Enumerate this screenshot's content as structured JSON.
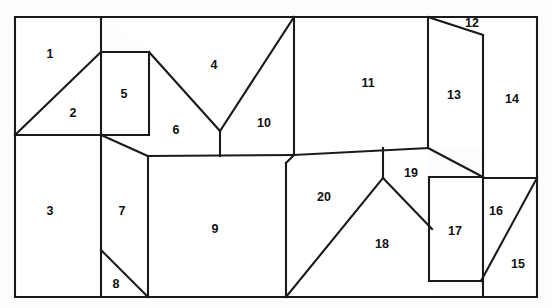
{
  "diagram": {
    "kind": "polygon-subdivision",
    "canvas": {
      "width": 552,
      "height": 308
    },
    "outer_boundary": {
      "name": "outer-rectangle",
      "left": 15,
      "top": 17,
      "right": 537,
      "bottom": 297,
      "points": "15,17 537,17 537,297 15,297"
    },
    "style": {
      "stroke_color": "#1a1a1a",
      "fill_color": "#ffffff",
      "background_color": "#fdfdfd",
      "label_color": "#111111",
      "stroke_width": 2.1
    },
    "region_count": 20,
    "regions": [
      {
        "id": 1,
        "label": "1",
        "label_x": 50,
        "label_y": 55,
        "points": "15,17 101,17 101,52 15,135"
      },
      {
        "id": 2,
        "label": "2",
        "label_x": 73,
        "label_y": 114,
        "points": "15,135 101,52 101,135"
      },
      {
        "id": 3,
        "label": "3",
        "label_x": 50,
        "label_y": 212,
        "points": "15,135 101,135 101,297 15,297"
      },
      {
        "id": 4,
        "label": "4",
        "label_x": 214,
        "label_y": 66,
        "points": "101,17 294,17 220,131 149,52"
      },
      {
        "id": 5,
        "label": "5",
        "label_x": 124,
        "label_y": 95,
        "points": "101,52 149,52 149,135 101,135"
      },
      {
        "id": 6,
        "label": "6",
        "label_x": 176,
        "label_y": 131,
        "points": "149,52 220,131 220,156 148,156 101,135 149,135"
      },
      {
        "id": 7,
        "label": "7",
        "label_x": 122,
        "label_y": 212,
        "points": "101,135 148,156 148,297 101,297"
      },
      {
        "id": 8,
        "label": "8",
        "label_x": 116,
        "label_y": 285,
        "points": "101,250 148,297 101,297"
      },
      {
        "id": 9,
        "label": "9",
        "label_x": 215,
        "label_y": 230,
        "points": "148,156 286,156 286,297 148,297"
      },
      {
        "id": 10,
        "label": "10",
        "label_x": 264,
        "label_y": 124,
        "points": "220,131 294,17 294,156 220,156"
      },
      {
        "id": 11,
        "label": "11",
        "label_x": 368,
        "label_y": 84,
        "points": "294,17 428,17 428,148 294,155"
      },
      {
        "id": 12,
        "label": "12",
        "label_x": 472,
        "label_y": 24,
        "points": "428,17 483,17 483,35"
      },
      {
        "id": 13,
        "label": "13",
        "label_x": 454,
        "label_y": 96,
        "points": "428,17 483,35 483,148 428,148"
      },
      {
        "id": 14,
        "label": "14",
        "label_x": 512,
        "label_y": 100,
        "points": "483,17 537,17 537,178 483,178"
      },
      {
        "id": 15,
        "label": "15",
        "label_x": 518,
        "label_y": 265,
        "points": "481,281 537,178 537,297 481,297"
      },
      {
        "id": 16,
        "label": "16",
        "label_x": 496,
        "label_y": 212,
        "points": "483,178 537,178 481,281 483,281"
      },
      {
        "id": 17,
        "label": "17",
        "label_x": 455,
        "label_y": 232,
        "points": "429,177 481,177 481,281 429,281"
      },
      {
        "id": 18,
        "label": "18",
        "label_x": 382,
        "label_y": 245,
        "points": "383,178 432,229 432,297 286,297"
      },
      {
        "id": 19,
        "label": "19",
        "label_x": 411,
        "label_y": 174,
        "points": "383,148 428,148 432,229 383,178"
      },
      {
        "id": 20,
        "label": "20",
        "label_x": 324,
        "label_y": 198,
        "points": "294,155 383,148 383,178 286,297 286,163"
      }
    ],
    "edges": [
      {
        "name": "outer-top",
        "points": "15,17 537,17"
      },
      {
        "name": "outer-right",
        "points": "537,17 537,297"
      },
      {
        "name": "outer-bottom",
        "points": "537,297 15,297"
      },
      {
        "name": "outer-left",
        "points": "15,297 15,17"
      },
      {
        "name": "edge-v-101",
        "points": "101,17 101,297"
      },
      {
        "name": "edge-h-135",
        "points": "15,135 101,135"
      },
      {
        "name": "edge-diag-2",
        "points": "15,135 101,52"
      },
      {
        "name": "edge-r5-top",
        "points": "101,52 149,52"
      },
      {
        "name": "edge-r5-right",
        "points": "149,52 149,135"
      },
      {
        "name": "edge-r5-bot",
        "points": "101,135 149,135"
      },
      {
        "name": "edge-diag-4a",
        "points": "149,52 220,131"
      },
      {
        "name": "edge-diag-4b",
        "points": "220,131 294,17"
      },
      {
        "name": "edge-v-220",
        "points": "220,131 220,156"
      },
      {
        "name": "edge-diag-7",
        "points": "101,135 148,156"
      },
      {
        "name": "edge-v-148",
        "points": "148,156 148,297"
      },
      {
        "name": "edge-diag-8",
        "points": "101,250 148,297"
      },
      {
        "name": "edge-h-156",
        "points": "148,156 294,155"
      },
      {
        "name": "edge-v-294",
        "points": "294,17 294,155"
      },
      {
        "name": "edge-notch-20",
        "points": "294,155 286,163"
      },
      {
        "name": "edge-v-286",
        "points": "286,163 286,297"
      },
      {
        "name": "edge-h-148",
        "points": "294,155 428,148"
      },
      {
        "name": "edge-v-428",
        "points": "428,17 428,148"
      },
      {
        "name": "edge-diag-12",
        "points": "428,17 483,35"
      },
      {
        "name": "edge-v-483",
        "points": "483,35 483,297"
      },
      {
        "name": "edge-v-383",
        "points": "383,148 383,178"
      },
      {
        "name": "edge-diag-18a",
        "points": "286,297 383,178"
      },
      {
        "name": "edge-diag-18b",
        "points": "383,178 432,229"
      },
      {
        "name": "edge-diag-19",
        "points": "428,148 483,177"
      },
      {
        "name": "edge-h-178",
        "points": "483,178 537,178"
      },
      {
        "name": "edge-r17-top",
        "points": "429,177 483,177"
      },
      {
        "name": "edge-r17-left",
        "points": "429,177 429,281"
      },
      {
        "name": "edge-r17-bot",
        "points": "429,281 483,281"
      },
      {
        "name": "edge-diag-15",
        "points": "481,281 537,178"
      }
    ]
  }
}
